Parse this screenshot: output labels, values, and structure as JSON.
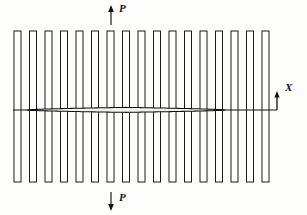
{
  "figure": {
    "type": "engineering-diagram",
    "width": 307,
    "height": 215,
    "background_color": "#fdfdfc"
  },
  "labels": {
    "force_top": "P",
    "force_bottom": "P",
    "axis_x": "X"
  },
  "colors": {
    "stroke": "#111111",
    "bar_stroke": "#1a1a1a",
    "bar_fill": "#ffffff",
    "foil_fill": "#f2f2f0",
    "background": "#fdfdfc"
  },
  "diagram_data": {
    "bars": {
      "count": 17,
      "x_start": 14,
      "pitch": 15.5,
      "width": 7,
      "y_top": 31,
      "y_bottom": 182,
      "note": "open rectangular outlines"
    },
    "axis": {
      "y": 110,
      "x_start": 13,
      "x_end": 277,
      "orientation": "horizontal"
    },
    "airfoil": {
      "leading_edge_x": 27,
      "trailing_edge_x": 225,
      "chord_y": 110,
      "max_thickness": 5,
      "max_thickness_x": 125,
      "shape": "thin lens / symmetric airfoil"
    },
    "force_arrows": [
      {
        "name": "top",
        "label": "P",
        "x": 111,
        "y_tail": 25,
        "y_head": 5,
        "direction": "up"
      },
      {
        "name": "bottom",
        "label": "P",
        "x": 111,
        "y_tail": 192,
        "y_head": 211,
        "direction": "down"
      }
    ],
    "axis_marker": {
      "label": "X",
      "x": 277,
      "y_tail": 110,
      "y_head": 91,
      "direction": "up"
    }
  }
}
